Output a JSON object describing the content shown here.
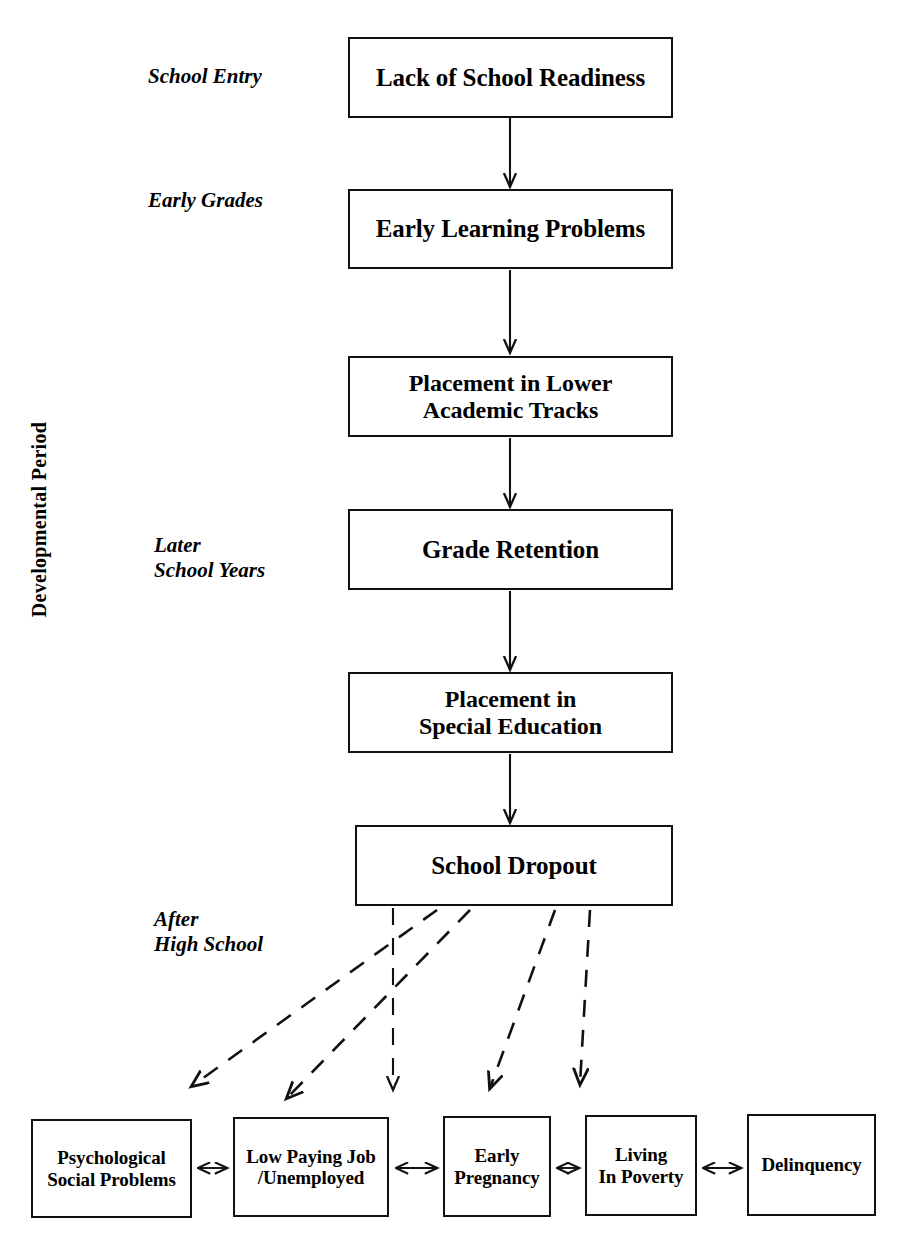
{
  "diagram": {
    "axis_label": "Developmental Period",
    "period_labels": [
      {
        "name": "school-entry",
        "text": "School Entry"
      },
      {
        "name": "early-grades",
        "text": "Early Grades"
      },
      {
        "name": "later-school-years",
        "text": "Later\nSchool Years"
      },
      {
        "name": "after-high-school",
        "text": "After\nHigh School"
      }
    ],
    "nodes": [
      {
        "id": "readiness",
        "label": "Lack of School Readiness"
      },
      {
        "id": "learning",
        "label": "Early Learning Problems"
      },
      {
        "id": "tracks",
        "label": "Placement in Lower\nAcademic Tracks"
      },
      {
        "id": "retention",
        "label": "Grade Retention"
      },
      {
        "id": "specialed",
        "label": "Placement in\nSpecial Education"
      },
      {
        "id": "dropout",
        "label": "School Dropout"
      },
      {
        "id": "psych",
        "label": "Psychological\nSocial Problems"
      },
      {
        "id": "lowpay",
        "label": "Low Paying Job\n/Unemployed"
      },
      {
        "id": "pregnancy",
        "label": "Early\nPregnancy"
      },
      {
        "id": "poverty",
        "label": "Living\nIn Poverty"
      },
      {
        "id": "delinquency",
        "label": "Delinquency"
      }
    ],
    "edges": [
      {
        "from": "readiness",
        "to": "learning",
        "style": "solid-arrow"
      },
      {
        "from": "learning",
        "to": "tracks",
        "style": "solid-arrow"
      },
      {
        "from": "tracks",
        "to": "retention",
        "style": "solid-arrow"
      },
      {
        "from": "retention",
        "to": "specialed",
        "style": "solid-arrow"
      },
      {
        "from": "specialed",
        "to": "dropout",
        "style": "solid-arrow"
      },
      {
        "from": "dropout",
        "to": "psych",
        "style": "dashed-arrow"
      },
      {
        "from": "dropout",
        "to": "lowpay",
        "style": "dashed-arrow"
      },
      {
        "from": "dropout",
        "to": "pregnancy",
        "style": "dashed-arrow"
      },
      {
        "from": "dropout",
        "to": "poverty",
        "style": "dashed-arrow"
      },
      {
        "from": "dropout",
        "to": "delinquency",
        "style": "dashed-arrow"
      },
      {
        "from": "psych",
        "to": "lowpay",
        "style": "double-arrow"
      },
      {
        "from": "lowpay",
        "to": "pregnancy",
        "style": "double-arrow"
      },
      {
        "from": "pregnancy",
        "to": "poverty",
        "style": "double-arrow"
      },
      {
        "from": "poverty",
        "to": "delinquency",
        "style": "double-arrow"
      }
    ],
    "colors": {
      "ink": "#111111",
      "background": "#ffffff"
    }
  }
}
